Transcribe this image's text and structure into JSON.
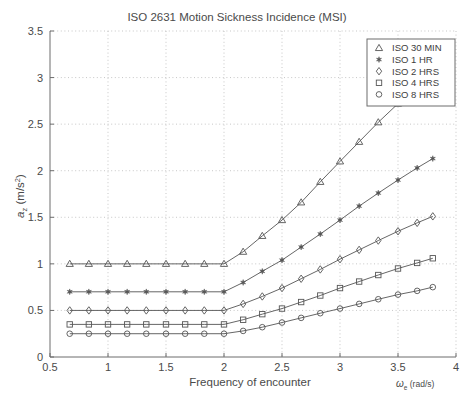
{
  "chart_data": {
    "type": "line",
    "title": "ISO 2631 Motion Sickness Incidence (MSI)",
    "xlabel": "Frequency of encounter",
    "xunit": "ωe (rad/s)",
    "ylabel": "az (m/s2)",
    "xlim": [
      0.5,
      4
    ],
    "ylim": [
      0,
      3.5
    ],
    "xticks": [
      0.5,
      1,
      1.5,
      2,
      2.5,
      3,
      3.5,
      4
    ],
    "xticklabels": [
      "0.5",
      "1",
      "1.5",
      "2",
      "2.5",
      "3",
      "3.5",
      "4"
    ],
    "yticks": [
      0,
      0.5,
      1,
      1.5,
      2,
      2.5,
      3,
      3.5
    ],
    "yticklabels": [
      "0",
      "0.5",
      "1",
      "1.5",
      "2",
      "2.5",
      "3",
      "3.5"
    ],
    "grid": true,
    "grid_style": "dotted",
    "legend_position": "top-right",
    "x": [
      0.67,
      0.835,
      1.0,
      1.165,
      1.33,
      1.5,
      1.665,
      1.83,
      2.0,
      2.165,
      2.33,
      2.5,
      2.665,
      2.83,
      3.0,
      3.165,
      3.33,
      3.5,
      3.665,
      3.8
    ],
    "series": [
      {
        "name": "ISO 30 MIN",
        "marker": "triangle",
        "values": [
          1.0,
          1.0,
          1.0,
          1.0,
          1.0,
          1.0,
          1.0,
          1.0,
          1.0,
          1.13,
          1.3,
          1.47,
          1.66,
          1.88,
          2.1,
          2.31,
          2.52,
          2.72,
          2.9,
          3.02
        ]
      },
      {
        "name": "ISO 1 HR",
        "marker": "star",
        "values": [
          0.7,
          0.7,
          0.7,
          0.7,
          0.7,
          0.7,
          0.7,
          0.7,
          0.7,
          0.8,
          0.92,
          1.04,
          1.18,
          1.32,
          1.47,
          1.62,
          1.76,
          1.9,
          2.03,
          2.13
        ]
      },
      {
        "name": "ISO 2 HRS",
        "marker": "diamond",
        "values": [
          0.5,
          0.5,
          0.5,
          0.5,
          0.5,
          0.5,
          0.5,
          0.5,
          0.5,
          0.57,
          0.65,
          0.74,
          0.84,
          0.94,
          1.05,
          1.15,
          1.25,
          1.35,
          1.44,
          1.51
        ]
      },
      {
        "name": "ISO 4 HRS",
        "marker": "square",
        "values": [
          0.35,
          0.35,
          0.35,
          0.35,
          0.35,
          0.35,
          0.35,
          0.35,
          0.35,
          0.4,
          0.46,
          0.52,
          0.59,
          0.66,
          0.74,
          0.81,
          0.88,
          0.95,
          1.01,
          1.06
        ]
      },
      {
        "name": "ISO 8 HRS",
        "marker": "circle",
        "values": [
          0.25,
          0.25,
          0.25,
          0.25,
          0.25,
          0.25,
          0.25,
          0.25,
          0.25,
          0.28,
          0.32,
          0.37,
          0.42,
          0.47,
          0.52,
          0.57,
          0.62,
          0.67,
          0.71,
          0.75
        ]
      }
    ]
  }
}
